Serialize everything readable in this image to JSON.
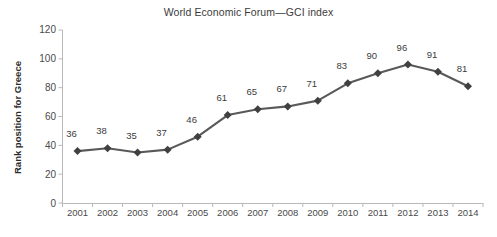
{
  "chart_data": {
    "type": "line",
    "title": "World Economic Forum—GCI index",
    "xlabel": "",
    "ylabel": "Rank position for Greece",
    "categories": [
      "2001",
      "2002",
      "2003",
      "2004",
      "2005",
      "2006",
      "2007",
      "2008",
      "2009",
      "2010",
      "2011",
      "2012",
      "2013",
      "2014"
    ],
    "values": [
      36,
      38,
      35,
      37,
      46,
      61,
      65,
      67,
      71,
      83,
      90,
      96,
      91,
      81
    ],
    "series": [
      {
        "name": "Rank position for Greece",
        "values": [
          36,
          38,
          35,
          37,
          46,
          61,
          65,
          67,
          71,
          83,
          90,
          96,
          91,
          81
        ]
      }
    ],
    "ylim": [
      0,
      120
    ],
    "yticks": [
      0,
      20,
      40,
      60,
      80,
      100,
      120
    ],
    "ytick_labels": [
      "0",
      "20",
      "40",
      "60",
      "80",
      "100",
      "120"
    ],
    "grid": false,
    "legend": "none",
    "data_labels": [
      "36",
      "38",
      "35",
      "37",
      "46",
      "61",
      "65",
      "67",
      "71",
      "83",
      "90",
      "96",
      "91",
      "81"
    ],
    "marker": "diamond",
    "line_color": "#595959",
    "marker_color": "#404040",
    "axis_color": "#b8b8b8",
    "text_color": "#3b3b3b",
    "background": "#ffffff"
  }
}
